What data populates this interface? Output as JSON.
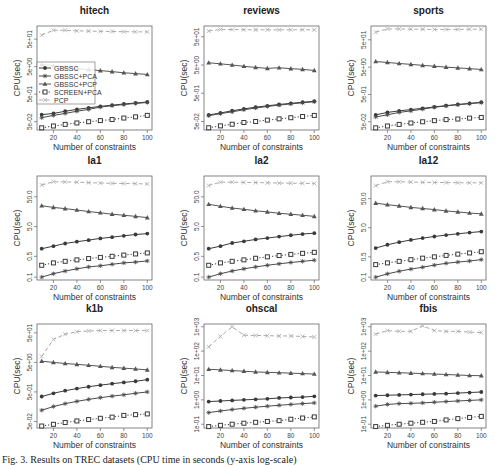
{
  "chart_data": {
    "type": "line",
    "layout": "3x3 grid",
    "x": [
      10,
      20,
      30,
      40,
      50,
      60,
      70,
      80,
      90,
      100
    ],
    "xlabel": "Number of constraints",
    "ylabel": "CPU(sec)",
    "yscale": "log",
    "xticks": [
      20,
      40,
      60,
      80,
      100
    ],
    "xlim": [
      10,
      100
    ],
    "legend": {
      "panel": "hitech",
      "placement": "center-left",
      "entries": [
        {
          "name": "GBSSC",
          "marker": "filled-circle",
          "line": "solid",
          "color": "#444444"
        },
        {
          "name": "GBSSC+PCA",
          "marker": "star",
          "line": "solid",
          "color": "#444444"
        },
        {
          "name": "GBSSC+PCP",
          "marker": "triangle",
          "line": "solid",
          "color": "#555555"
        },
        {
          "name": "SCREEN+PCA",
          "marker": "square",
          "line": "dotted",
          "color": "#444444"
        },
        {
          "name": "PCP",
          "marker": "x",
          "line": "dashed",
          "color": "#aaaaaa"
        }
      ]
    },
    "panels": [
      {
        "title": "hitech",
        "yticks": [
          0.05,
          0.5,
          5,
          50
        ],
        "ytick_labels": [
          "5e-02",
          "5e-01",
          "5e+00",
          "5e+01"
        ],
        "ylim": [
          0.025,
          150
        ],
        "series": [
          {
            "name": "GBSSC",
            "values": [
              0.09,
              0.1,
              0.12,
              0.14,
              0.16,
              0.18,
              0.2,
              0.22,
              0.24,
              0.26
            ]
          },
          {
            "name": "GBSSC+PCA",
            "values": [
              0.07,
              0.085,
              0.1,
              0.12,
              0.14,
              0.17,
              0.19,
              0.21,
              0.23,
              0.25
            ]
          },
          {
            "name": "GBSSC+PCP",
            "values": [
              6.0,
              5.4,
              4.8,
              4.3,
              3.9,
              3.6,
              3.3,
              3.0,
              2.8,
              2.6
            ]
          },
          {
            "name": "SCREEN+PCA",
            "values": [
              0.03,
              0.035,
              0.04,
              0.045,
              0.05,
              0.055,
              0.06,
              0.068,
              0.075,
              0.085
            ]
          },
          {
            "name": "PCP",
            "values": [
              70,
              105,
              105,
              100,
              98,
              96,
              95,
              93,
              92,
              92
            ]
          }
        ]
      },
      {
        "title": "reviews",
        "yticks": [
          0.05,
          0.5,
          5,
          50
        ],
        "ytick_labels": [
          "5e-02",
          "5e-01",
          "5e+00",
          "5e+01"
        ],
        "ylim": [
          0.025,
          120
        ],
        "series": [
          {
            "name": "GBSSC",
            "values": [
              0.085,
              0.1,
              0.12,
              0.14,
              0.16,
              0.18,
              0.2,
              0.22,
              0.24,
              0.26
            ]
          },
          {
            "name": "GBSSC+PCA",
            "values": [
              0.08,
              0.095,
              0.11,
              0.13,
              0.15,
              0.17,
              0.19,
              0.21,
              0.23,
              0.25
            ]
          },
          {
            "name": "GBSSC+PCP",
            "values": [
              6.0,
              5.5,
              5.0,
              4.5,
              4.1,
              3.8,
              4.0,
              3.7,
              3.5,
              3.2
            ]
          },
          {
            "name": "SCREEN+PCA",
            "values": [
              0.03,
              0.035,
              0.04,
              0.046,
              0.05,
              0.056,
              0.062,
              0.068,
              0.075,
              0.082
            ]
          },
          {
            "name": "PCP",
            "values": [
              80,
              90,
              90,
              89,
              88,
              88,
              88,
              88,
              88,
              88
            ]
          }
        ]
      },
      {
        "title": "sports",
        "yticks": [
          0.05,
          0.5,
          5,
          50
        ],
        "ytick_labels": [
          "5e-02",
          "5e-01",
          "5e+00",
          "5e+01"
        ],
        "ylim": [
          0.025,
          160
        ],
        "series": [
          {
            "name": "GBSSC",
            "values": [
              0.09,
              0.11,
              0.125,
              0.14,
              0.155,
              0.175,
              0.195,
              0.215,
              0.235,
              0.26
            ]
          },
          {
            "name": "GBSSC+PCA",
            "values": [
              0.075,
              0.09,
              0.11,
              0.125,
              0.145,
              0.17,
              0.19,
              0.21,
              0.23,
              0.25
            ]
          },
          {
            "name": "GBSSC+PCP",
            "values": [
              8.0,
              7.4,
              6.8,
              6.3,
              5.8,
              5.4,
              5.0,
              4.7,
              4.4,
              4.1
            ]
          },
          {
            "name": "SCREEN+PCA",
            "values": [
              0.03,
              0.035,
              0.04,
              0.045,
              0.05,
              0.055,
              0.06,
              0.063,
              0.068,
              0.072
            ]
          },
          {
            "name": "PCP",
            "values": [
              95,
              125,
              125,
              122,
              122,
              120,
              120,
              120,
              122,
              122
            ]
          }
        ]
      },
      {
        "title": "la1",
        "yticks": [
          0.1,
          0.5,
          5,
          50
        ],
        "ytick_labels": [
          "0.1",
          "0.5",
          "5.0",
          "50.0"
        ],
        "ylim": [
          0.08,
          250
        ],
        "series": [
          {
            "name": "GBSSC",
            "values": [
              0.9,
              1.1,
              1.35,
              1.55,
              1.75,
              2.0,
              2.2,
              2.45,
              2.7,
              2.9
            ]
          },
          {
            "name": "GBSSC+PCA",
            "values": [
              0.1,
              0.13,
              0.16,
              0.19,
              0.22,
              0.24,
              0.27,
              0.3,
              0.32,
              0.35
            ]
          },
          {
            "name": "GBSSC+PCP",
            "values": [
              25,
              22,
              20,
              18,
              16,
              14.5,
              13,
              12,
              11,
              10
            ]
          },
          {
            "name": "SCREEN+PCA",
            "values": [
              0.25,
              0.3,
              0.34,
              0.38,
              0.42,
              0.46,
              0.5,
              0.55,
              0.6,
              0.65
            ]
          },
          {
            "name": "PCP",
            "values": [
              125,
              160,
              158,
              155,
              150,
              145,
              142,
              140,
              138,
              135
            ]
          }
        ]
      },
      {
        "title": "la2",
        "yticks": [
          0.1,
          0.5,
          5,
          50
        ],
        "ytick_labels": [
          "0.1",
          "0.5",
          "5.0",
          "50.0"
        ],
        "ylim": [
          0.08,
          250
        ],
        "series": [
          {
            "name": "GBSSC",
            "values": [
              0.9,
              1.1,
              1.4,
              1.6,
              1.85,
              2.05,
              2.3,
              2.55,
              2.8,
              3.0
            ]
          },
          {
            "name": "GBSSC+PCA",
            "values": [
              0.1,
              0.13,
              0.16,
              0.19,
              0.22,
              0.25,
              0.28,
              0.31,
              0.34,
              0.37
            ]
          },
          {
            "name": "GBSSC+PCP",
            "values": [
              28,
              24,
              21,
              19,
              17,
              15.5,
              14,
              13,
              12,
              11
            ]
          },
          {
            "name": "SCREEN+PCA",
            "values": [
              0.25,
              0.3,
              0.34,
              0.38,
              0.43,
              0.48,
              0.53,
              0.58,
              0.63,
              0.68
            ]
          },
          {
            "name": "PCP",
            "values": [
              120,
              155,
              155,
              152,
              150,
              148,
              145,
              143,
              142,
              140
            ]
          }
        ]
      },
      {
        "title": "la12",
        "yticks": [
          0.1,
          0.5,
          5,
          50
        ],
        "ytick_labels": [
          "0.1",
          "0.5",
          "5.0",
          "50.0"
        ],
        "ylim": [
          0.08,
          300
        ],
        "series": [
          {
            "name": "GBSSC",
            "values": [
              1.0,
              1.3,
              1.6,
              1.9,
              2.2,
              2.5,
              2.8,
              3.1,
              3.4,
              3.7
            ]
          },
          {
            "name": "GBSSC+PCA",
            "values": [
              0.1,
              0.13,
              0.16,
              0.19,
              0.22,
              0.26,
              0.3,
              0.33,
              0.36,
              0.4
            ]
          },
          {
            "name": "GBSSC+PCP",
            "values": [
              35,
              31,
              28,
              25,
              23,
              21,
              19,
              17.5,
              16,
              15
            ]
          },
          {
            "name": "SCREEN+PCA",
            "values": [
              0.27,
              0.31,
              0.35,
              0.4,
              0.45,
              0.5,
              0.56,
              0.62,
              0.68,
              0.75
            ]
          },
          {
            "name": "PCP",
            "values": [
              140,
              190,
              190,
              185,
              182,
              180,
              178,
              176,
              175,
              175
            ]
          }
        ]
      },
      {
        "title": "k1b",
        "yticks": [
          0.05,
          0.5,
          5,
          50
        ],
        "ytick_labels": [
          "5e-02",
          "5e-01",
          "5e+00",
          "5e+01"
        ],
        "ylim": [
          0.03,
          100
        ],
        "series": [
          {
            "name": "GBSSC",
            "values": [
              0.35,
              0.45,
              0.55,
              0.65,
              0.75,
              0.85,
              0.95,
              1.05,
              1.15,
              1.3
            ]
          },
          {
            "name": "GBSSC+PCA",
            "values": [
              0.12,
              0.16,
              0.2,
              0.24,
              0.28,
              0.32,
              0.36,
              0.4,
              0.45,
              0.5
            ]
          },
          {
            "name": "GBSSC+PCP",
            "values": [
              5.5,
              5.0,
              4.6,
              4.3,
              4.0,
              3.7,
              3.4,
              3.2,
              3.0,
              2.8
            ]
          },
          {
            "name": "SCREEN+PCA",
            "values": [
              0.035,
              0.04,
              0.046,
              0.052,
              0.058,
              0.064,
              0.07,
              0.08,
              0.085,
              0.09
            ]
          },
          {
            "name": "PCP",
            "values": [
              8,
              30,
              45,
              55,
              58,
              60,
              60,
              60,
              60,
              60
            ]
          }
        ]
      },
      {
        "title": "ohscal",
        "yticks": [
          0.1,
          1,
          10,
          100,
          1000
        ],
        "ytick_labels": [
          "1e-01",
          "1e+00",
          "1e+01",
          "1e+02",
          "1e+03"
        ],
        "ylim": [
          0.07,
          1300
        ],
        "series": [
          {
            "name": "GBSSC",
            "values": [
              0.85,
              0.9,
              0.95,
              1.0,
              1.05,
              1.1,
              1.2,
              1.25,
              1.3,
              1.4
            ]
          },
          {
            "name": "GBSSC+PCA",
            "values": [
              0.3,
              0.35,
              0.4,
              0.45,
              0.5,
              0.55,
              0.6,
              0.65,
              0.7,
              0.75
            ]
          },
          {
            "name": "GBSSC+PCP",
            "values": [
              18,
              17,
              16,
              15,
              14,
              13.5,
              13,
              12.5,
              12,
              11.5
            ]
          },
          {
            "name": "SCREEN+PCA",
            "values": [
              0.08,
              0.09,
              0.1,
              0.11,
              0.12,
              0.13,
              0.14,
              0.16,
              0.18,
              0.2
            ]
          },
          {
            "name": "PCP",
            "values": [
              150,
              400,
              1000,
              450,
              440,
              430,
              420,
              420,
              400,
              380
            ]
          }
        ]
      },
      {
        "title": "fbis",
        "yticks": [
          0.1,
          1,
          10,
          100,
          1000
        ],
        "ytick_labels": [
          "1e-01",
          "1e+00",
          "1e+01",
          "1e+02",
          "1e+03"
        ],
        "ylim": [
          0.07,
          1300
        ],
        "series": [
          {
            "name": "GBSSC",
            "values": [
              1.5,
              1.55,
              1.6,
              1.65,
              1.7,
              1.75,
              1.8,
              1.9,
              2.0,
              2.1
            ]
          },
          {
            "name": "GBSSC+PCA",
            "values": [
              0.55,
              0.65,
              0.7,
              0.72,
              0.75,
              0.8,
              0.85,
              0.9,
              0.95,
              1.0
            ]
          },
          {
            "name": "GBSSC+PCP",
            "values": [
              14,
              13.5,
              13,
              12.5,
              12,
              11.5,
              11,
              10.5,
              10,
              9.8
            ]
          },
          {
            "name": "SCREEN+PCA",
            "values": [
              0.08,
              0.09,
              0.1,
              0.11,
              0.12,
              0.13,
              0.15,
              0.17,
              0.19,
              0.21
            ]
          },
          {
            "name": "PCP",
            "values": [
              500,
              700,
              650,
              650,
              1100,
              700,
              650,
              650,
              600,
              580
            ]
          }
        ]
      }
    ]
  },
  "caption": "Fig. 3. Results on TREC datasets (CPU time in seconds (y-axis log-scale)"
}
